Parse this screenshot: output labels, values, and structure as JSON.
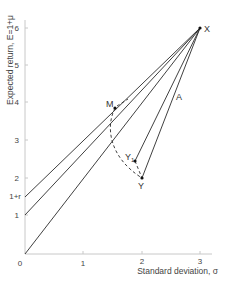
{
  "diagram": {
    "x_axis": {
      "label": "Standard deviation, σ",
      "ticks": [
        "0",
        "1",
        "2",
        "3"
      ]
    },
    "y_axis": {
      "label": "Expected return, E=1+μ",
      "ticks": [
        "1",
        "2",
        "3",
        "4",
        "5",
        "6"
      ],
      "special_tick": "1+r"
    },
    "points": {
      "X": {
        "label": "X",
        "sigma": 3,
        "E": 6
      },
      "M": {
        "label": "M",
        "sigma": 1.55,
        "E": 3.85
      },
      "Y": {
        "label": "Y",
        "sigma": 2.0,
        "E": 2.0
      },
      "Y1": {
        "label": "Y",
        "sub": "1",
        "sigma": 1.88,
        "E": 2.45
      }
    },
    "line_label": "A",
    "lines": [
      {
        "from": [
          0,
          0
        ],
        "to": [
          3,
          6
        ]
      },
      {
        "from": [
          0,
          1
        ],
        "to": [
          3,
          6
        ]
      },
      {
        "from": [
          0,
          1.5
        ],
        "to": [
          3,
          6
        ]
      },
      {
        "from": "Y",
        "to": "X"
      },
      {
        "from": "Y1",
        "to": "X"
      }
    ]
  }
}
